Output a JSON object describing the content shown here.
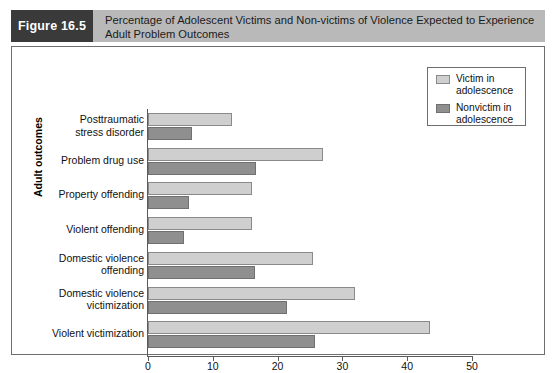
{
  "figure": {
    "number_label": "Figure 16.5",
    "caption_line1": "Percentage of Adolescent Victims and Non-victims of Violence Expected to Experience",
    "caption_line2": "Adult Problem Outcomes"
  },
  "legend": {
    "items": [
      {
        "label_line1": "Victim in",
        "label_line2": "adolescence",
        "color": "#cfcfcf",
        "swatch_name": "legend-swatch-victim"
      },
      {
        "label_line1": "Nonvictim in",
        "label_line2": "adolescence",
        "color": "#8f8f8f",
        "swatch_name": "legend-swatch-nonvictim"
      }
    ]
  },
  "axis": {
    "x_title": "Percentage",
    "y_title": "Adult outcomes",
    "x_ticks": [
      "0",
      "10",
      "20",
      "30",
      "40",
      "50"
    ]
  },
  "categories_display": [
    {
      "line1": "Posttraumatic",
      "line2": "stress disorder"
    },
    {
      "line1": "Problem drug use",
      "line2": ""
    },
    {
      "line1": "Property offending",
      "line2": ""
    },
    {
      "line1": "Violent offending",
      "line2": ""
    },
    {
      "line1": "Domestic violence",
      "line2": "offending"
    },
    {
      "line1": "Domestic violence",
      "line2": "victimization"
    },
    {
      "line1": "Violent victimization",
      "line2": ""
    }
  ],
  "chart_data": {
    "type": "bar",
    "orientation": "horizontal",
    "title": "Percentage of Adolescent Victims and Non-victims of Violence Expected to Experience Adult Problem Outcomes",
    "xlabel": "Percentage",
    "ylabel": "Adult outcomes",
    "xlim": [
      0,
      50
    ],
    "xticks": [
      0,
      10,
      20,
      30,
      40,
      50
    ],
    "grid": false,
    "legend_position": "top-right",
    "categories": [
      "Posttraumatic stress disorder",
      "Problem drug use",
      "Property offending",
      "Violent offending",
      "Domestic violence offending",
      "Domestic violence victimization",
      "Violent victimization"
    ],
    "series": [
      {
        "name": "Victim in adolescence",
        "color": "#cfcfcf",
        "values": [
          13,
          27,
          16,
          16,
          25.5,
          32,
          43.5
        ]
      },
      {
        "name": "Nonvictim in adolescence",
        "color": "#8f8f8f",
        "values": [
          6.8,
          16.7,
          6.4,
          5.5,
          16.5,
          21.5,
          25.7
        ]
      }
    ]
  }
}
